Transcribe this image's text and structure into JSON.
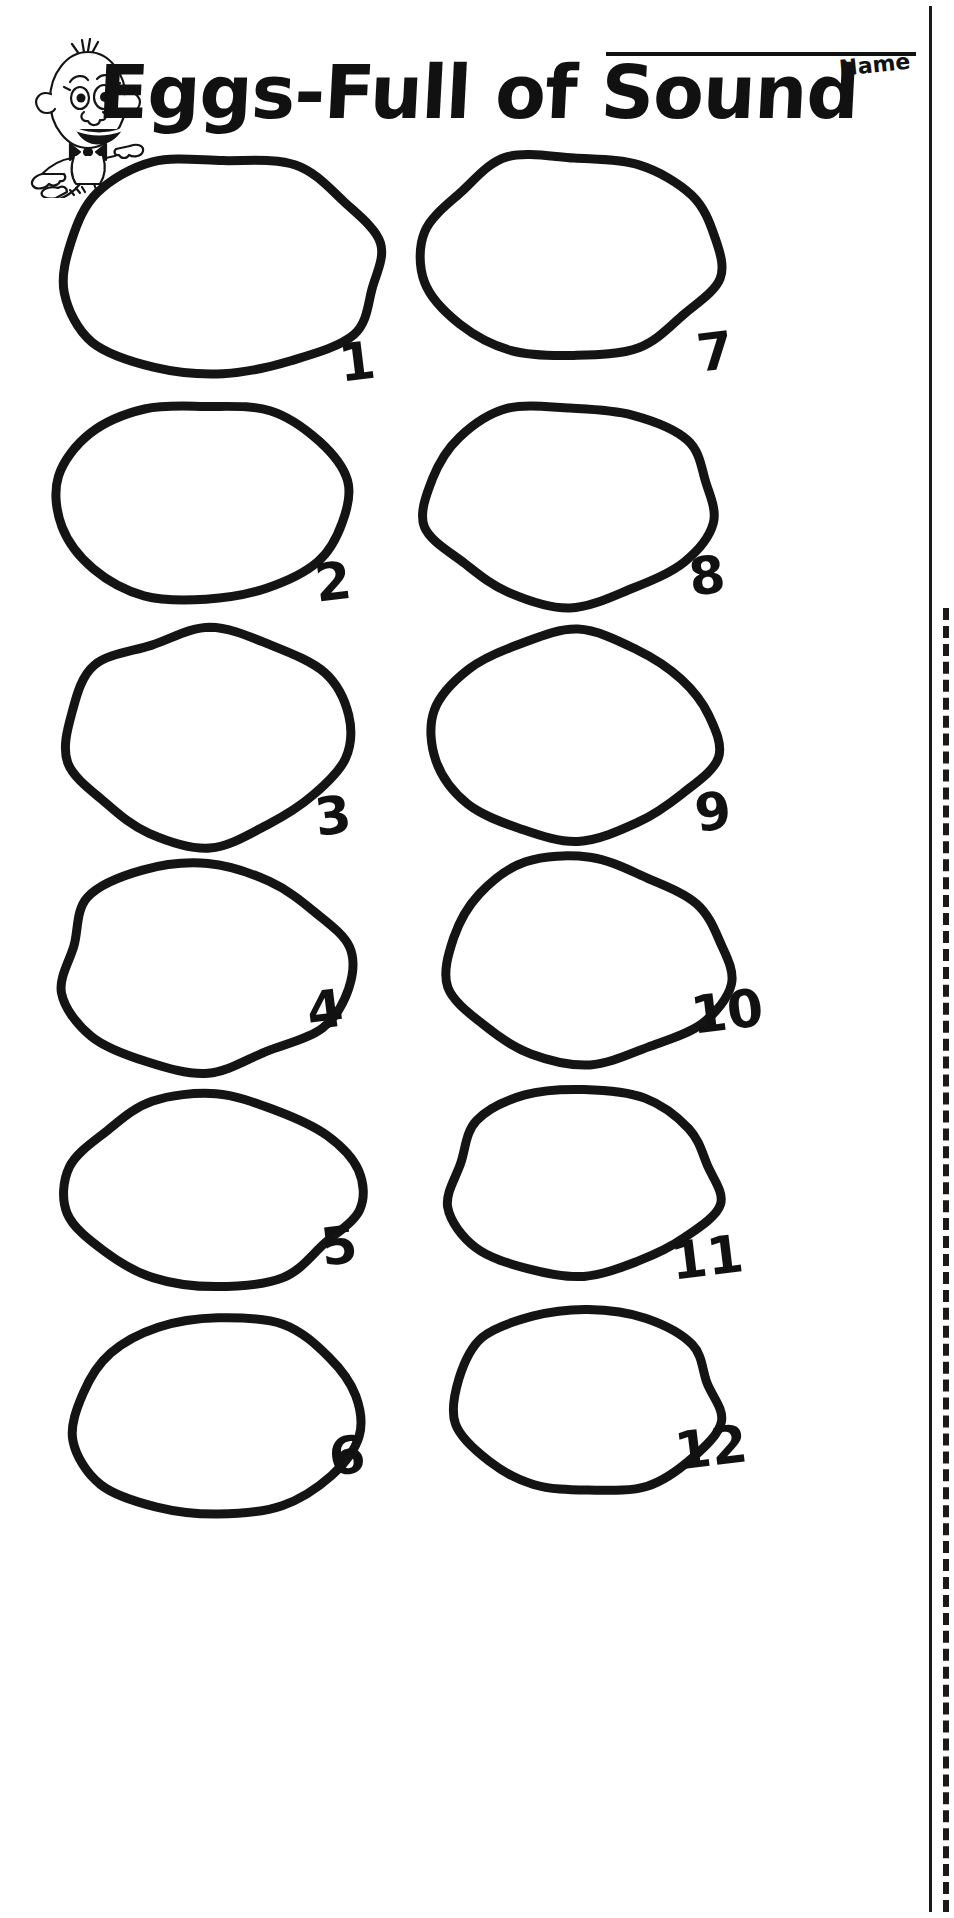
{
  "page": {
    "title": "Eggs-Full of Sound",
    "background_color": "#ffffff",
    "ink_color": "#141414"
  },
  "header": {
    "title": "Eggs-Full of Sound",
    "name_label": "Name",
    "mascot_icon": "egg-character-icon",
    "name_line_present": true
  },
  "rules": {
    "solid_rule_icon": "vertical-solid-rule",
    "dashed_rule_icon": "vertical-dashed-rule"
  },
  "eggs": [
    {
      "number": "1",
      "left": 58,
      "top": 150,
      "width": 330,
      "height": 232,
      "num_left": 336,
      "num_top": 338
    },
    {
      "number": "2",
      "left": 56,
      "top": 394,
      "width": 300,
      "height": 216,
      "num_left": 312,
      "num_top": 558
    },
    {
      "number": "3",
      "left": 62,
      "top": 626,
      "width": 296,
      "height": 222,
      "num_left": 312,
      "num_top": 792
    },
    {
      "number": "4",
      "left": 56,
      "top": 860,
      "width": 304,
      "height": 216,
      "num_left": 304,
      "num_top": 986
    },
    {
      "number": "5",
      "left": 62,
      "top": 1088,
      "width": 308,
      "height": 204,
      "num_left": 318,
      "num_top": 1222
    },
    {
      "number": "6",
      "left": 68,
      "top": 1310,
      "width": 300,
      "height": 212,
      "num_left": 326,
      "num_top": 1432
    },
    {
      "number": "7",
      "left": 420,
      "top": 148,
      "width": 308,
      "height": 218,
      "num_left": 694,
      "num_top": 328
    },
    {
      "number": "8",
      "left": 420,
      "top": 396,
      "width": 300,
      "height": 212,
      "num_left": 686,
      "num_top": 552
    },
    {
      "number": "9",
      "left": 432,
      "top": 628,
      "width": 292,
      "height": 216,
      "num_left": 692,
      "num_top": 788
    },
    {
      "number": "10",
      "left": 444,
      "top": 854,
      "width": 292,
      "height": 216,
      "num_left": 688,
      "num_top": 990
    },
    {
      "number": "11",
      "left": 444,
      "top": 1084,
      "width": 280,
      "height": 200,
      "num_left": 668,
      "num_top": 1236
    },
    {
      "number": "12",
      "left": 452,
      "top": 1302,
      "width": 272,
      "height": 198,
      "num_left": 672,
      "num_top": 1426
    }
  ]
}
